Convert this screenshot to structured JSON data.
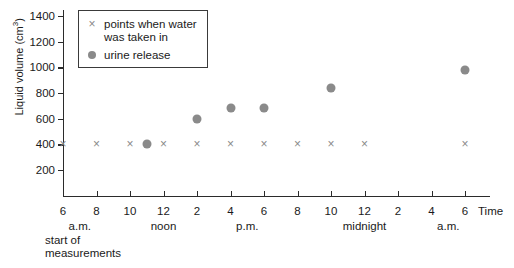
{
  "chart_data": {
    "type": "scatter",
    "title": "",
    "xlabel": "Time",
    "ylabel": "Liquid volume (cm3)",
    "ylabel_prefix": "Liquid volume (cm",
    "ylabel_sup": "3",
    "ylabel_suffix": ")",
    "ylim": [
      0,
      1400
    ],
    "yticks": [
      200,
      400,
      600,
      800,
      1000,
      1200,
      1400
    ],
    "ytick_labels": [
      "200",
      "400",
      "600",
      "800",
      "1000",
      "1200",
      "1400"
    ],
    "xlim": [
      6,
      30
    ],
    "xticks": [
      6,
      8,
      10,
      12,
      14,
      16,
      18,
      20,
      22,
      24,
      26,
      28,
      30
    ],
    "xtick_labels": [
      "6",
      "8",
      "10",
      "12",
      "2",
      "4",
      "6",
      "8",
      "10",
      "12",
      "2",
      "4",
      "6"
    ],
    "x_sublabels": [
      {
        "label": "a.m.",
        "x": 7
      },
      {
        "label": "noon",
        "x": 12
      },
      {
        "label": "p.m.",
        "x": 17
      },
      {
        "label": "midnight",
        "x": 24
      },
      {
        "label": "a.m.",
        "x": 29
      }
    ],
    "grid": false,
    "legend_position": "top-left",
    "series": [
      {
        "name": "points when water was taken in",
        "marker": "x",
        "color": "#8a8a8a",
        "points": [
          {
            "x": 6,
            "y": 400
          },
          {
            "x": 8,
            "y": 400
          },
          {
            "x": 10,
            "y": 400
          },
          {
            "x": 12,
            "y": 400
          },
          {
            "x": 14,
            "y": 400
          },
          {
            "x": 16,
            "y": 400
          },
          {
            "x": 18,
            "y": 400
          },
          {
            "x": 20,
            "y": 400
          },
          {
            "x": 22,
            "y": 400
          },
          {
            "x": 24,
            "y": 400
          },
          {
            "x": 30,
            "y": 400
          }
        ]
      },
      {
        "name": "urine release",
        "marker": "dot",
        "color": "#8a8a8a",
        "points": [
          {
            "x": 11,
            "y": 400
          },
          {
            "x": 14,
            "y": 600
          },
          {
            "x": 16,
            "y": 680
          },
          {
            "x": 18,
            "y": 680
          },
          {
            "x": 22,
            "y": 840
          },
          {
            "x": 30,
            "y": 980
          }
        ]
      }
    ],
    "annotations": [
      {
        "text": "start of",
        "x": 6,
        "line": 1
      },
      {
        "text": "measurements",
        "x": 6,
        "line": 2
      }
    ]
  },
  "legend": {
    "entries": [
      {
        "marker": "x",
        "line1": "points when water",
        "line2": "was taken in"
      },
      {
        "marker": "dot",
        "line1": "urine release",
        "line2": ""
      }
    ]
  },
  "colors": {
    "marker": "#8a8a8a",
    "axis": "#2b2b2b",
    "text": "#1a1a1a",
    "legend_border": "#3a3a3a"
  }
}
